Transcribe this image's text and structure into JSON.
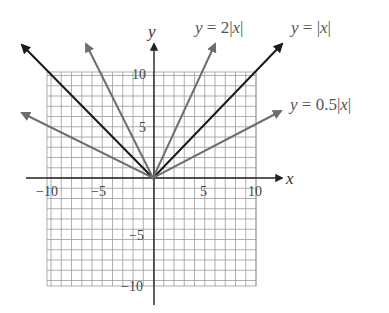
{
  "chart_data": {
    "type": "line",
    "title": "",
    "xlabel": "x",
    "ylabel": "y",
    "xlim": [
      -10,
      10
    ],
    "ylim": [
      -10,
      10
    ],
    "grid": true,
    "grid_step": 1,
    "x_ticks": [
      -10,
      -5,
      5,
      10
    ],
    "y_ticks": [
      10,
      5,
      -5,
      -10
    ],
    "x_tick_labels": [
      "−10",
      "−5",
      "5",
      "10"
    ],
    "y_tick_labels": [
      "10",
      "5",
      "−5",
      "−10"
    ],
    "series": [
      {
        "name": "y = 2|x|",
        "function": "2|x|",
        "color": "#6e6e6e",
        "x": [
          -6.5,
          0,
          6.1
        ],
        "y": [
          13,
          0,
          12.2
        ]
      },
      {
        "name": "y = |x|",
        "function": "|x|",
        "color": "#1a1a1a",
        "x": [
          -12.9,
          0,
          12.6
        ],
        "y": [
          12.9,
          0,
          12.6
        ]
      },
      {
        "name": "y = 0.5|x|",
        "function": "0.5|x|",
        "color": "#6e6e6e",
        "x": [
          -12.8,
          0,
          12.5
        ],
        "y": [
          6.4,
          0,
          6.25
        ]
      }
    ],
    "legend_position": "inline labels at upper right"
  },
  "labels": {
    "x_axis": "x",
    "y_axis": "y",
    "series_2abs_prefix": "y",
    "series_2abs_eq": " = 2|",
    "series_2abs_var": "x",
    "series_2abs_end": "|",
    "series_abs_prefix": "y",
    "series_abs_eq": " = |",
    "series_abs_var": "x",
    "series_abs_end": "|",
    "series_half_prefix": "y",
    "series_half_eq": " = 0.5|",
    "series_half_var": "x",
    "series_half_end": "|",
    "tick_x_neg10": "−10",
    "tick_x_neg5": "−5",
    "tick_x_5": "5",
    "tick_x_10": "10",
    "tick_y_10": "10",
    "tick_y_5": "5",
    "tick_y_neg5": "−5",
    "tick_y_neg10": "−10"
  },
  "colors": {
    "grid": "#9a9a9a",
    "axis": "#222222",
    "line_dark": "#1a1a1a",
    "line_gray": "#6e6e6e"
  }
}
